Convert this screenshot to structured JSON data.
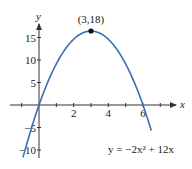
{
  "chart_data": {
    "type": "line",
    "title": "",
    "xlabel": "x",
    "ylabel": "y",
    "equation": "y = −2x² + 12x",
    "series": [
      {
        "name": "y = -2x^2 + 12x",
        "color": "#3a6fb5",
        "x": [
          -0.9,
          -0.5,
          0,
          0.5,
          1,
          1.5,
          2,
          2.5,
          3,
          3.5,
          4,
          4.5,
          5,
          5.5,
          6,
          6.5
        ],
        "y": [
          -12.42,
          -6.5,
          0,
          5.5,
          10,
          13.5,
          16,
          17.5,
          18,
          17.5,
          16,
          13.5,
          10,
          5.5,
          0,
          -6.5
        ]
      }
    ],
    "annotations": [
      {
        "label": "(3,18)",
        "x": 3,
        "y": 18,
        "marker": "dot"
      }
    ],
    "x_ticks": [
      -1,
      0,
      1,
      2,
      3,
      4,
      5,
      6,
      7
    ],
    "x_tick_labels": [
      {
        "value": 2,
        "label": "2"
      },
      {
        "value": 4,
        "label": "4"
      },
      {
        "value": 6,
        "label": "6"
      }
    ],
    "y_ticks": [
      -10,
      -5,
      0,
      5,
      10,
      15
    ],
    "y_tick_labels": [
      {
        "value": 15,
        "label": "15"
      },
      {
        "value": 10,
        "label": "10"
      },
      {
        "value": 5,
        "label": "5"
      },
      {
        "value": -5,
        "label": "−5"
      },
      {
        "value": -10,
        "label": "−10"
      }
    ],
    "xlim": [
      -1.5,
      8
    ],
    "ylim": [
      -12,
      20
    ],
    "grid": false,
    "legend": "none"
  },
  "layout": {
    "origin_px": [
      39,
      105
    ],
    "x_px_per_unit": 17.33,
    "y_px_per_unit_axis": 4.5,
    "y_px_per_unit_curve": 4.11,
    "axis_color": "#333333",
    "curve_color": "#3a6fb5"
  }
}
